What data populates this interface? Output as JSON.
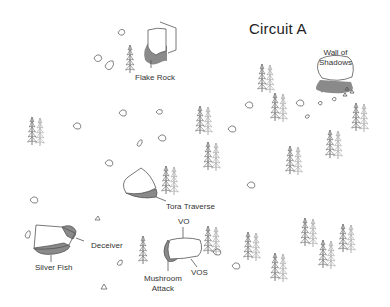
{
  "map": {
    "title": "Circuit A",
    "boulders": [
      {
        "id": "flake-rock",
        "name": "Flake Rock"
      },
      {
        "id": "wall-of-shadows",
        "name": "Wall of Shadows",
        "name_line1": "Wall of",
        "name_line2": "Shadows"
      },
      {
        "id": "tora-traverse",
        "name": "Tora Traverse"
      },
      {
        "id": "silver-fish",
        "name": "Silver Fish"
      },
      {
        "id": "deceiver",
        "name": "Deceiver"
      },
      {
        "id": "vo",
        "name": "VO"
      },
      {
        "id": "vos",
        "name": "VOS"
      },
      {
        "id": "mushroom-attack",
        "name": "Mushroom Attack",
        "name_line1": "Mushroom",
        "name_line2": "Attack"
      }
    ],
    "colors": {
      "outline": "#555555",
      "shadow": "#8a8a8a",
      "tree": "#666666",
      "text": "#333333"
    }
  }
}
